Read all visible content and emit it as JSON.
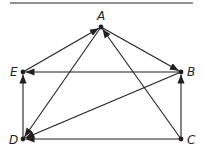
{
  "diagram": {
    "type": "directed-graph",
    "colors": {
      "stroke": "#231f20",
      "background": "#ffffff"
    },
    "top_rule": {
      "x1": 10,
      "y1": 3,
      "x2": 193,
      "y2": 3
    },
    "nodes": [
      {
        "id": "A",
        "label": "A",
        "x": 101,
        "y": 27,
        "lx": 97,
        "ly": 20
      },
      {
        "id": "B",
        "label": "B",
        "x": 181,
        "y": 72,
        "lx": 187,
        "ly": 76
      },
      {
        "id": "C",
        "label": "C",
        "x": 181,
        "y": 139,
        "lx": 187,
        "ly": 144
      },
      {
        "id": "D",
        "label": "D",
        "x": 23,
        "y": 139,
        "lx": 9,
        "ly": 144
      },
      {
        "id": "E",
        "label": "E",
        "x": 23,
        "y": 72,
        "lx": 10,
        "ly": 76
      }
    ],
    "edges": [
      {
        "from": "E",
        "to": "A"
      },
      {
        "from": "A",
        "to": "B"
      },
      {
        "from": "A",
        "to": "D"
      },
      {
        "from": "C",
        "to": "A"
      },
      {
        "from": "B",
        "to": "E"
      },
      {
        "from": "B",
        "to": "D"
      },
      {
        "from": "D",
        "to": "E"
      },
      {
        "from": "C",
        "to": "B"
      },
      {
        "from": "C",
        "to": "D"
      }
    ]
  }
}
